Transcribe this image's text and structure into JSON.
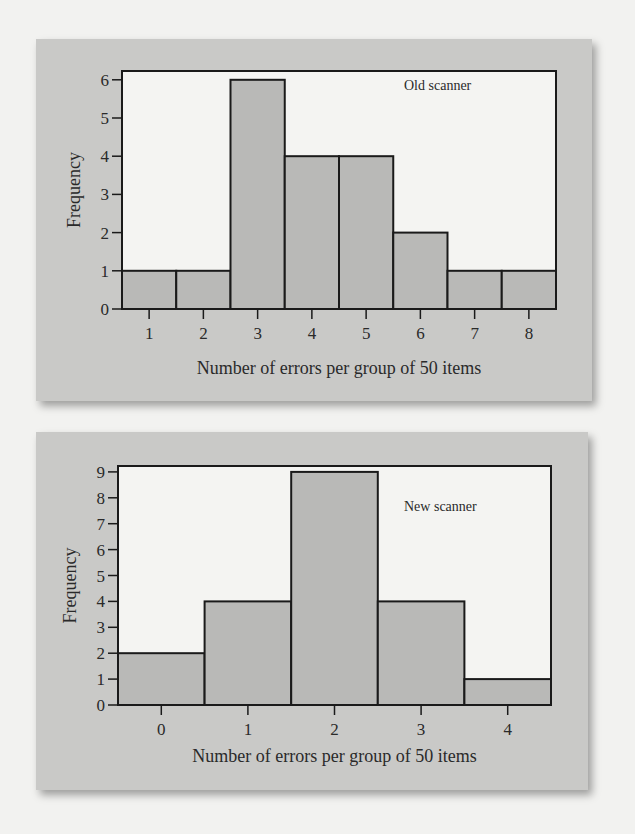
{
  "chart_data": [
    {
      "type": "bar",
      "title": "Old scanner",
      "annotation": "Old scanner",
      "xlabel": "Number of errors per group of 50 items",
      "ylabel": "Frequency",
      "categories": [
        "1",
        "2",
        "3",
        "4",
        "5",
        "6",
        "7",
        "8"
      ],
      "values": [
        1,
        1,
        6,
        4,
        4,
        2,
        1,
        1
      ],
      "yticks": [
        0,
        1,
        2,
        3,
        4,
        5,
        6
      ],
      "ylim": [
        0,
        6.2
      ],
      "grid": false,
      "legend_position": "top-right inside",
      "colors": {
        "bar": "#b9b9b7",
        "plot_bg": "#f4f4f2",
        "panel_bg": "#c9c9c7"
      }
    },
    {
      "type": "bar",
      "title": "New scanner",
      "annotation": "New scanner",
      "xlabel": "Number of errors per group of 50 items",
      "ylabel": "Frequency",
      "categories": [
        "0",
        "1",
        "2",
        "3",
        "4"
      ],
      "values": [
        2,
        4,
        9,
        4,
        1
      ],
      "yticks": [
        0,
        1,
        2,
        3,
        4,
        5,
        6,
        7,
        8,
        9
      ],
      "ylim": [
        0,
        9.2
      ],
      "grid": false,
      "legend_position": "top-right inside",
      "colors": {
        "bar": "#b9b9b7",
        "plot_bg": "#f4f4f2",
        "panel_bg": "#c9c9c7"
      }
    }
  ]
}
